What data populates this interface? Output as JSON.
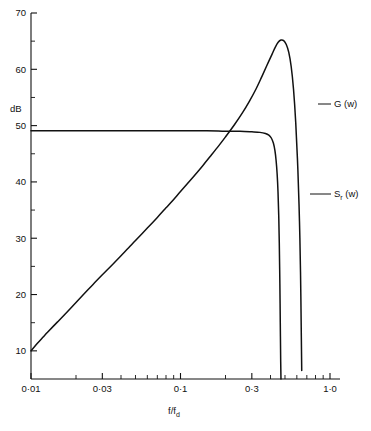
{
  "chart_data": {
    "type": "line",
    "title": "",
    "xlabel": "f/f_d",
    "xlabel_main": "f/f",
    "xlabel_sub": "d",
    "ylabel": "dB",
    "xscale": "log",
    "xlim": [
      0.01,
      1.0
    ],
    "ylim": [
      5,
      70
    ],
    "grid": false,
    "legend_position": "right-inline-annotations",
    "x_tick_labels": [
      "0·01",
      "0·03",
      "0·1",
      "0·3",
      "1·0"
    ],
    "x_tick_values": [
      0.01,
      0.03,
      0.1,
      0.3,
      1.0
    ],
    "x_minor_tick_values": [
      0.02,
      0.04,
      0.05,
      0.06,
      0.07,
      0.08,
      0.09,
      0.2,
      0.4,
      0.5,
      0.6,
      0.7,
      0.8,
      0.9
    ],
    "y_tick_labels": [
      "70",
      "60",
      "50",
      "40",
      "30",
      "20",
      "10"
    ],
    "y_tick_values": [
      70,
      60,
      50,
      40,
      30,
      20,
      10
    ],
    "y_minor_tick_values": [
      65,
      55,
      45,
      35,
      25,
      15
    ],
    "series": [
      {
        "name": "G (w)",
        "label_main": "G (w)",
        "color": "#111111",
        "points": [
          [
            0.01,
            10.0
          ],
          [
            0.011,
            11.3
          ],
          [
            0.012,
            12.4
          ],
          [
            0.013,
            13.4
          ],
          [
            0.015,
            15.1
          ],
          [
            0.017,
            16.6
          ],
          [
            0.02,
            18.6
          ],
          [
            0.023,
            20.3
          ],
          [
            0.026,
            21.8
          ],
          [
            0.03,
            23.5
          ],
          [
            0.035,
            25.3
          ],
          [
            0.04,
            26.9
          ],
          [
            0.045,
            28.3
          ],
          [
            0.05,
            29.6
          ],
          [
            0.06,
            31.8
          ],
          [
            0.07,
            33.7
          ],
          [
            0.08,
            35.4
          ],
          [
            0.09,
            36.9
          ],
          [
            0.1,
            38.3
          ],
          [
            0.12,
            40.7
          ],
          [
            0.14,
            42.8
          ],
          [
            0.16,
            44.7
          ],
          [
            0.18,
            46.4
          ],
          [
            0.2,
            48.0
          ],
          [
            0.23,
            50.2
          ],
          [
            0.26,
            52.3
          ],
          [
            0.29,
            54.4
          ],
          [
            0.32,
            56.5
          ],
          [
            0.35,
            58.7
          ],
          [
            0.38,
            60.8
          ],
          [
            0.41,
            62.7
          ],
          [
            0.43,
            63.9
          ],
          [
            0.45,
            64.8
          ],
          [
            0.47,
            65.2
          ],
          [
            0.49,
            65.1
          ],
          [
            0.51,
            64.4
          ],
          [
            0.53,
            63.0
          ],
          [
            0.55,
            60.5
          ],
          [
            0.57,
            56.5
          ],
          [
            0.59,
            50.5
          ],
          [
            0.61,
            42.0
          ],
          [
            0.625,
            33.0
          ],
          [
            0.635,
            24.0
          ],
          [
            0.642,
            14.0
          ],
          [
            0.647,
            6.5
          ]
        ]
      },
      {
        "name": "S_r (w)",
        "label_main": "S",
        "label_sub": "r",
        "label_tail": " (w)",
        "color": "#111111",
        "points": [
          [
            0.01,
            49.1
          ],
          [
            0.03,
            49.1
          ],
          [
            0.06,
            49.1
          ],
          [
            0.1,
            49.1
          ],
          [
            0.15,
            49.1
          ],
          [
            0.2,
            49.0
          ],
          [
            0.25,
            49.0
          ],
          [
            0.3,
            48.9
          ],
          [
            0.34,
            48.8
          ],
          [
            0.37,
            48.6
          ],
          [
            0.39,
            48.3
          ],
          [
            0.405,
            47.8
          ],
          [
            0.418,
            46.9
          ],
          [
            0.428,
            45.6
          ],
          [
            0.436,
            43.8
          ],
          [
            0.443,
            41.4
          ],
          [
            0.449,
            38.2
          ],
          [
            0.454,
            34.0
          ],
          [
            0.458,
            29.0
          ],
          [
            0.462,
            22.0
          ],
          [
            0.465,
            15.0
          ],
          [
            0.468,
            8.0
          ],
          [
            0.47,
            5.0
          ]
        ]
      }
    ],
    "annotations": [
      {
        "text": "G (w)",
        "series": "G (w)",
        "x": 0.62,
        "y": 56.0
      },
      {
        "text": "S_r (w)",
        "series": "S_r (w)",
        "x": 0.47,
        "y": 37.5
      }
    ]
  },
  "axis": {
    "y_axis_title": "dB",
    "x_axis_title_main": "f/f",
    "x_axis_title_sub": "d"
  },
  "labels": {
    "g_label": "G (w)",
    "sr_label_main": "S",
    "sr_label_sub": "r",
    "sr_label_tail": " (w)"
  }
}
